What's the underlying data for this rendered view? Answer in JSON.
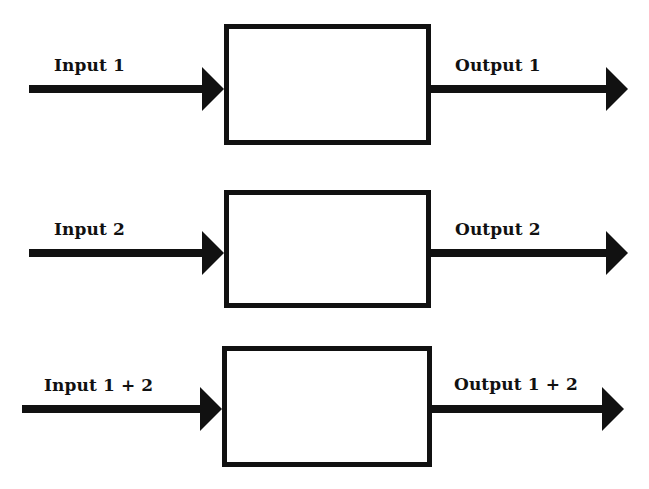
{
  "diagram": {
    "colors": {
      "stroke": "#111111",
      "background": "#ffffff"
    },
    "rows": [
      {
        "input_label": "Input 1",
        "output_label": "Output 1",
        "box": {
          "x": 224,
          "y": 24,
          "w": 207,
          "h": 121
        },
        "arrow_y": 89,
        "input_start_x": 29,
        "output_tip_x": 628,
        "input_label_pos": {
          "x": 54,
          "y": 55
        },
        "output_label_pos": {
          "x": 455,
          "y": 55
        }
      },
      {
        "input_label": "Input 2",
        "output_label": "Output 2",
        "box": {
          "x": 224,
          "y": 190,
          "w": 207,
          "h": 118
        },
        "arrow_y": 253,
        "input_start_x": 29,
        "output_tip_x": 628,
        "input_label_pos": {
          "x": 54,
          "y": 219
        },
        "output_label_pos": {
          "x": 455,
          "y": 219
        }
      },
      {
        "input_label": "Input 1 + 2",
        "output_label": "Output 1 + 2",
        "box": {
          "x": 222,
          "y": 346,
          "w": 210,
          "h": 121
        },
        "arrow_y": 409,
        "input_start_x": 22,
        "output_tip_x": 624,
        "input_label_pos": {
          "x": 44,
          "y": 375
        },
        "output_label_pos": {
          "x": 454,
          "y": 374
        }
      }
    ]
  }
}
